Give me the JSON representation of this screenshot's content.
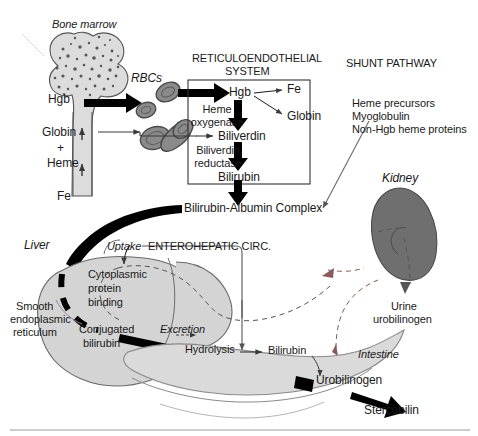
{
  "figure": {
    "colors": {
      "bone_fill": "#dcdcdc",
      "bone_stroke": "#555555",
      "marrow_speckle": "#555555",
      "rbc_fill": "#8a8a8a",
      "rbc_stroke": "#4a4a4a",
      "liver_fill": "#d4d4d4",
      "liver_stroke": "#6a6a6a",
      "kidney_fill": "#6f6f6f",
      "kidney_stroke": "#4a4a4a",
      "intestine_fill": "#dadada",
      "intestine_stroke": "#8a8a8a",
      "arrow_thick": "#000000",
      "arrow_thin": "#3a3a3a",
      "box_stroke": "#333333",
      "dashed": "#555555",
      "text": "#1a1a1a",
      "rule": "#999999"
    }
  },
  "bone_marrow": {
    "title": "Bone marrow",
    "hgb": "Hgb",
    "globin": "Globin",
    "plus": "+",
    "heme": "Heme",
    "fe": "Fe"
  },
  "rbcs": {
    "label": "RBCs"
  },
  "res": {
    "title_line1": "RETICULOENDOTHELIAL",
    "title_line2": "SYSTEM",
    "hgb": "Hgb",
    "fe": "Fe",
    "globin": "Globin",
    "heme_oxygenase_line1": "Heme",
    "heme_oxygenase_line2": "oxygenase",
    "biliverdin": "Biliverdin",
    "biliverdin_reductase_line1": "Biliverdin",
    "biliverdin_reductase_line2": "reductase",
    "bilirubin": "Bilirubin"
  },
  "shunt": {
    "title": "SHUNT PATHWAY",
    "items": [
      "Heme precursors",
      "Myoglobulin",
      "Non-Hgb heme proteins"
    ]
  },
  "transport": {
    "bilirubin_albumin": "Bilirubin-Albumin Complex"
  },
  "liver": {
    "label": "Liver",
    "uptake": "Uptake",
    "cytoplasmic_line1": "Cytoplasmic",
    "cytoplasmic_line2": "protein",
    "cytoplasmic_line3": "binding",
    "ser_line1": "Smooth",
    "ser_line2": "endoplasmic",
    "ser_line3": "reticulum",
    "conjugated_line1": "Conjugated",
    "conjugated_line2": "bilirubin",
    "excretion": "Excretion"
  },
  "enterohepatic": {
    "title": "ENTEROHEPATIC CIRC."
  },
  "intestine": {
    "label": "Intestine",
    "hydrolysis": "Hydrolysis",
    "bilirubin": "Bilirubin",
    "urobilinogen": "Urobilinogen",
    "stercobilin": "Stercobilin"
  },
  "kidney": {
    "label": "Kidney",
    "urine_line1": "Urine",
    "urine_line2": "urobilinogen"
  }
}
